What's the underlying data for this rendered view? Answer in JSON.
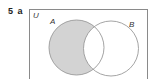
{
  "question": {
    "number": "5",
    "part": "a"
  },
  "diagram": {
    "type": "venn",
    "universal_label": "U",
    "sets": [
      {
        "label": "A",
        "shaded": "A only (A minus B)"
      },
      {
        "label": "B",
        "shaded": "none"
      }
    ],
    "shaded_region": "A ∩ B'",
    "colors": {
      "shade": "#d3d3d3",
      "outline": "#9a9a9a",
      "border": "#8a8a8a"
    }
  }
}
